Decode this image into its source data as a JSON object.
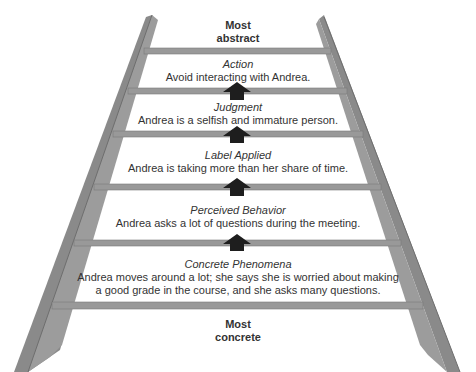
{
  "diagram": {
    "top_label": [
      "Most",
      "abstract"
    ],
    "bottom_label": [
      "Most",
      "concrete"
    ],
    "colors": {
      "rail": "#8d8d8d",
      "rail_dark": "#6f6f6f",
      "rung": "#949494",
      "arrow": "#222222"
    },
    "steps": [
      {
        "title": "Action",
        "text": [
          "Avoid interacting with Andrea."
        ]
      },
      {
        "title": "Judgment",
        "text": [
          "Andrea is a selfish and immature person."
        ]
      },
      {
        "title": "Label Applied",
        "text": [
          "Andrea is taking more than her share of time."
        ]
      },
      {
        "title": "Perceived Behavior",
        "text": [
          "Andrea asks a lot of questions during the meeting."
        ]
      },
      {
        "title": "Concrete Phenomena",
        "text": [
          "Andrea moves around a lot; she says she is worried about making",
          "a good grade in the course, and she asks many questions."
        ]
      }
    ]
  }
}
